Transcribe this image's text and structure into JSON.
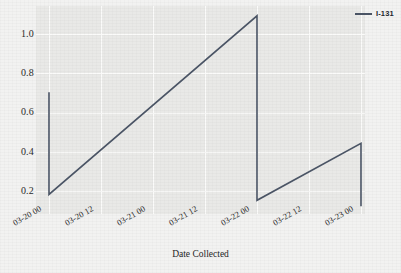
{
  "figure": {
    "background_color": "#f2f2f1",
    "plot_background_color": "#e9e9e7",
    "grid_color": "#fbfbfa"
  },
  "legend": {
    "position": "top-right",
    "entries": [
      {
        "label": "I-131",
        "color": "#4b5566",
        "swatch_name": "line-swatch"
      }
    ]
  },
  "footer": {
    "cut_off_text": "—"
  },
  "chart_data": {
    "type": "line",
    "title": "",
    "subtitle": "",
    "xlabel": "Date Collected",
    "ylabel": "",
    "grid": true,
    "legend_position": "upper right",
    "series": [
      {
        "name": "I-131",
        "color": "#4b5566",
        "points": [
          {
            "x": "03-20 00",
            "y": 0.69
          },
          {
            "x": "03-20 00",
            "y": 0.17
          },
          {
            "x": "03-22 00",
            "y": 1.08
          },
          {
            "x": "03-22 00",
            "y": 0.14
          },
          {
            "x": "03-23 00",
            "y": 0.43
          },
          {
            "x": "03-23 00",
            "y": 0.11
          }
        ]
      }
    ],
    "xticks": [
      "03-20 00",
      "03-20 12",
      "03-21 00",
      "03-21 12",
      "03-22 00",
      "03-22 12",
      "03-23 00"
    ],
    "yticks": [
      "0.2",
      "0.4",
      "0.6",
      "0.8",
      "1.0"
    ],
    "ytick_values": [
      0.2,
      0.4,
      0.6,
      0.8,
      1.0
    ],
    "ylim": [
      0.07,
      1.13
    ],
    "xlim": [
      "03-20 00",
      "03-23 02"
    ]
  }
}
